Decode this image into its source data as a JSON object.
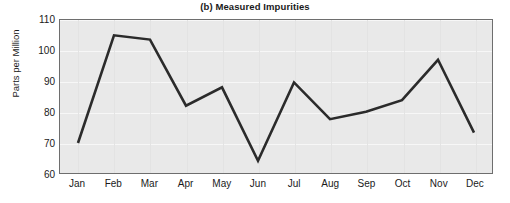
{
  "chart_data": {
    "type": "line",
    "title": "(b) Measured Impurities",
    "xlabel": "",
    "ylabel": "Parts per Million",
    "categories": [
      "Jan",
      "Feb",
      "Mar",
      "Apr",
      "May",
      "Jun",
      "Jul",
      "Aug",
      "Sep",
      "Oct",
      "Nov",
      "Dec"
    ],
    "values": [
      69.8,
      105.0,
      103.6,
      82.0,
      88.0,
      64.0,
      89.6,
      77.6,
      80.0,
      83.8,
      97.0,
      73.2
    ],
    "series": [
      {
        "name": "Measured Impurities",
        "values": [
          69.8,
          105.0,
          103.6,
          82.0,
          88.0,
          64.0,
          89.6,
          77.6,
          80.0,
          83.8,
          97.0,
          73.2
        ]
      }
    ],
    "ylim": [
      60,
      110
    ],
    "yticks": [
      60,
      70,
      80,
      90,
      100,
      110
    ],
    "ytick_labels": [
      "60",
      "70",
      "80",
      "90",
      "100",
      "110"
    ],
    "xtick_labels": [
      "Jan",
      "Feb",
      "Mar",
      "Apr",
      "May",
      "Jun",
      "Jul",
      "Aug",
      "Sep",
      "Oct",
      "Nov",
      "Dec"
    ],
    "grid": true,
    "legend": false,
    "line_color": "#2b2b2b",
    "line_width": 2.6,
    "plot_background": "#e9e9e9",
    "grid_color": "#f7f7f7",
    "axis_color": "#6e6e6e",
    "text_color": "#1a1a1a",
    "markers": false
  }
}
